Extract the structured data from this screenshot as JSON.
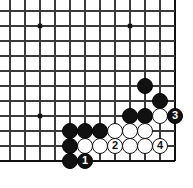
{
  "diagram": {
    "type": "go-board-problem",
    "board": {
      "grid_spacing": 15,
      "origin_x": 10,
      "origin_y": 11,
      "cols": 12,
      "rows": 11,
      "edge_right_col": 11,
      "edge_bottom_row": 10,
      "line_color": "#3a3a3a",
      "edge_color": "#111111",
      "background": "#ffffff"
    },
    "star_points": [
      {
        "col": 2,
        "row": 1
      },
      {
        "col": 8,
        "row": 1
      },
      {
        "col": 2,
        "row": 7
      }
    ],
    "stones": [
      {
        "col": 9,
        "row": 5,
        "color": "black",
        "label": ""
      },
      {
        "col": 10,
        "row": 6,
        "color": "black",
        "label": ""
      },
      {
        "col": 8,
        "row": 7,
        "color": "black",
        "label": ""
      },
      {
        "col": 9,
        "row": 7,
        "color": "black",
        "label": ""
      },
      {
        "col": 10,
        "row": 7,
        "color": "white",
        "label": ""
      },
      {
        "col": 11,
        "row": 7,
        "color": "black",
        "label": "3"
      },
      {
        "col": 4,
        "row": 8,
        "color": "black",
        "label": ""
      },
      {
        "col": 5,
        "row": 8,
        "color": "black",
        "label": ""
      },
      {
        "col": 6,
        "row": 8,
        "color": "black",
        "label": ""
      },
      {
        "col": 7,
        "row": 8,
        "color": "white",
        "label": ""
      },
      {
        "col": 8,
        "row": 8,
        "color": "white",
        "label": ""
      },
      {
        "col": 9,
        "row": 8,
        "color": "white",
        "label": ""
      },
      {
        "col": 4,
        "row": 9,
        "color": "black",
        "label": ""
      },
      {
        "col": 5,
        "row": 9,
        "color": "white",
        "label": ""
      },
      {
        "col": 6,
        "row": 9,
        "color": "white",
        "label": ""
      },
      {
        "col": 7,
        "row": 9,
        "color": "white",
        "label": "2"
      },
      {
        "col": 8,
        "row": 9,
        "color": "white",
        "label": ""
      },
      {
        "col": 9,
        "row": 9,
        "color": "white",
        "label": ""
      },
      {
        "col": 10,
        "row": 9,
        "color": "white",
        "label": "4"
      },
      {
        "col": 4,
        "row": 10,
        "color": "black",
        "label": ""
      },
      {
        "col": 5,
        "row": 10,
        "color": "black",
        "label": "1"
      }
    ],
    "move_labels": [
      "1",
      "2",
      "3",
      "4"
    ],
    "colors": {
      "black_stone": "#111111",
      "white_stone": "#ffffff",
      "white_stone_border": "#111111",
      "black_label_text": "#ffffff",
      "white_label_text": "#111111"
    }
  }
}
